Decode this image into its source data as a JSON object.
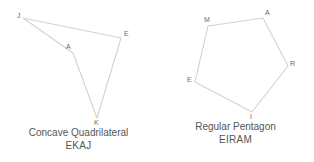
{
  "canvas": {
    "width": 314,
    "height": 162,
    "background": "#ffffff"
  },
  "style": {
    "stroke_color": "#d2d2d2",
    "label_color": "#6a6a6a",
    "caption_color": "#555555"
  },
  "figures": [
    {
      "id": "concave-quadrilateral",
      "caption_name": "Concave Quadrilateral",
      "caption_vertices": "EKAJ",
      "shape": "quadrilateral",
      "vertex_order": "E-K-A-J",
      "path": "M 121,38 L 97,118 L 73,53 L 23,18 Z",
      "vertices": [
        {
          "label": "J",
          "x": 23,
          "y": 18,
          "label_x": 17,
          "label_y": 12
        },
        {
          "label": "E",
          "x": 121,
          "y": 38,
          "label_x": 124,
          "label_y": 30
        },
        {
          "label": "A",
          "x": 73,
          "y": 53,
          "label_x": 66,
          "label_y": 43
        },
        {
          "label": "K",
          "x": 97,
          "y": 118,
          "label_x": 94,
          "label_y": 119
        }
      ]
    },
    {
      "id": "regular-pentagon",
      "caption_name": "Regular Pentagon",
      "caption_vertices": "EIRAM",
      "shape": "pentagon",
      "vertex_order": "E-I-R-A-M",
      "path": "M 38,82 L 95,112 L 131,66 L 106,18 L 51,26 Z",
      "vertices": [
        {
          "label": "M",
          "x": 51,
          "y": 26,
          "label_x": 47,
          "label_y": 16
        },
        {
          "label": "A",
          "x": 106,
          "y": 18,
          "label_x": 108,
          "label_y": 9
        },
        {
          "label": "R",
          "x": 131,
          "y": 66,
          "label_x": 133,
          "label_y": 60
        },
        {
          "label": "I",
          "x": 95,
          "y": 112,
          "label_x": 93,
          "label_y": 113
        },
        {
          "label": "E",
          "x": 38,
          "y": 82,
          "label_x": 30,
          "label_y": 76
        }
      ]
    }
  ]
}
